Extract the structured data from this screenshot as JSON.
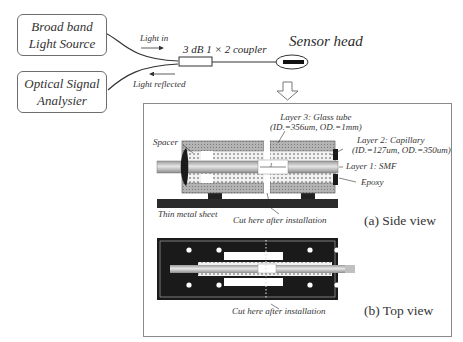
{
  "system": {
    "source_box": {
      "line1": "Broad band",
      "line2": "Light Source"
    },
    "analyser_box": {
      "line1": "Optical Signal",
      "line2": "Analysier"
    },
    "light_in_label": "Light in",
    "light_reflected_label": "Light reflected",
    "coupler_label": "3 dB 1 × 2 coupler",
    "sensor_head_label": "Sensor head"
  },
  "detail_panel": {
    "side_view": {
      "caption": "(a) Side view",
      "layer3_line1": "Layer 3: Glass tube",
      "layer3_line2": "(ID.=356um, OD.=1mm)",
      "layer2_line1": "Layer 2: Capillary",
      "layer2_line2": "(ID.=127um, OD.=350um)",
      "layer1": "Layer 1: SMF",
      "spacer": "Spacer",
      "epoxy": "Epoxy",
      "gap_symbol": "l",
      "thin_metal_sheet": "Thin metal sheet",
      "cut_label": "Cut here after installation"
    },
    "top_view": {
      "caption": "(b) Top view",
      "cut_label": "Cut here after installation"
    }
  },
  "colors": {
    "outline": "#6e6e6e",
    "dark_fill": "#1a1a1a",
    "hatch_gray": "#9a9a9a",
    "fiber_gray": "#b5b5b5"
  }
}
